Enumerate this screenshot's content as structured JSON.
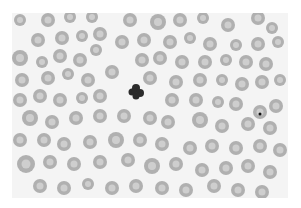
{
  "image": {
    "description": "Grayscale photomicrograph of a peripheral blood smear showing red blood cells and a central segmented neutrophil",
    "field_bg": "#f4f4f4",
    "cell_fill": "#a9a9a9",
    "cell_center": "#d2d2d2",
    "neutrophil_color": "#2b2b2b",
    "inclusion_color": "#111111"
  },
  "cells": [
    [
      20,
      20,
      6
    ],
    [
      48,
      20,
      7
    ],
    [
      70,
      17,
      6
    ],
    [
      92,
      17,
      6
    ],
    [
      130,
      20,
      7
    ],
    [
      158,
      22,
      8
    ],
    [
      180,
      20,
      7
    ],
    [
      203,
      18,
      6
    ],
    [
      228,
      25,
      7
    ],
    [
      258,
      18,
      7
    ],
    [
      272,
      28,
      6
    ],
    [
      38,
      40,
      7
    ],
    [
      62,
      38,
      7
    ],
    [
      82,
      36,
      6
    ],
    [
      100,
      34,
      7
    ],
    [
      122,
      42,
      7
    ],
    [
      144,
      40,
      7
    ],
    [
      170,
      42,
      7
    ],
    [
      190,
      38,
      6
    ],
    [
      210,
      44,
      7
    ],
    [
      236,
      45,
      6
    ],
    [
      258,
      44,
      7
    ],
    [
      278,
      42,
      6
    ],
    [
      20,
      58,
      8
    ],
    [
      42,
      62,
      6
    ],
    [
      60,
      56,
      7
    ],
    [
      80,
      60,
      7
    ],
    [
      96,
      50,
      6
    ],
    [
      142,
      60,
      7
    ],
    [
      160,
      58,
      7
    ],
    [
      182,
      62,
      7
    ],
    [
      205,
      62,
      7
    ],
    [
      226,
      60,
      6
    ],
    [
      246,
      62,
      7
    ],
    [
      266,
      64,
      7
    ],
    [
      22,
      80,
      7
    ],
    [
      48,
      78,
      7
    ],
    [
      68,
      74,
      6
    ],
    [
      88,
      80,
      7
    ],
    [
      112,
      72,
      7
    ],
    [
      150,
      78,
      7
    ],
    [
      176,
      82,
      7
    ],
    [
      200,
      80,
      7
    ],
    [
      222,
      80,
      6
    ],
    [
      242,
      84,
      7
    ],
    [
      262,
      82,
      7
    ],
    [
      280,
      80,
      6
    ],
    [
      20,
      100,
      7
    ],
    [
      40,
      96,
      7
    ],
    [
      60,
      100,
      7
    ],
    [
      82,
      98,
      6
    ],
    [
      100,
      96,
      7
    ],
    [
      172,
      100,
      7
    ],
    [
      196,
      100,
      7
    ],
    [
      218,
      102,
      6
    ],
    [
      236,
      104,
      7
    ],
    [
      276,
      106,
      7
    ],
    [
      30,
      118,
      8
    ],
    [
      52,
      122,
      7
    ],
    [
      76,
      118,
      7
    ],
    [
      100,
      116,
      7
    ],
    [
      124,
      116,
      7
    ],
    [
      150,
      118,
      7
    ],
    [
      168,
      122,
      7
    ],
    [
      200,
      120,
      8
    ],
    [
      222,
      126,
      7
    ],
    [
      248,
      124,
      7
    ],
    [
      270,
      128,
      7
    ],
    [
      20,
      140,
      7
    ],
    [
      44,
      140,
      7
    ],
    [
      64,
      144,
      7
    ],
    [
      90,
      142,
      7
    ],
    [
      116,
      140,
      8
    ],
    [
      140,
      140,
      7
    ],
    [
      162,
      144,
      7
    ],
    [
      190,
      148,
      7
    ],
    [
      212,
      146,
      7
    ],
    [
      236,
      148,
      7
    ],
    [
      260,
      146,
      7
    ],
    [
      280,
      150,
      7
    ],
    [
      26,
      164,
      9
    ],
    [
      50,
      162,
      7
    ],
    [
      74,
      164,
      7
    ],
    [
      100,
      162,
      7
    ],
    [
      128,
      160,
      7
    ],
    [
      152,
      166,
      8
    ],
    [
      176,
      164,
      7
    ],
    [
      202,
      170,
      7
    ],
    [
      226,
      168,
      7
    ],
    [
      248,
      166,
      7
    ],
    [
      270,
      172,
      7
    ],
    [
      40,
      186,
      7
    ],
    [
      64,
      188,
      7
    ],
    [
      88,
      184,
      6
    ],
    [
      112,
      188,
      7
    ],
    [
      136,
      186,
      7
    ],
    [
      162,
      188,
      7
    ],
    [
      186,
      190,
      7
    ],
    [
      214,
      186,
      7
    ],
    [
      238,
      190,
      7
    ],
    [
      262,
      192,
      7
    ]
  ],
  "neutrophil": {
    "x": 136,
    "y": 92
  },
  "inclusion_cell": {
    "x": 260,
    "y": 112,
    "r": 7
  }
}
